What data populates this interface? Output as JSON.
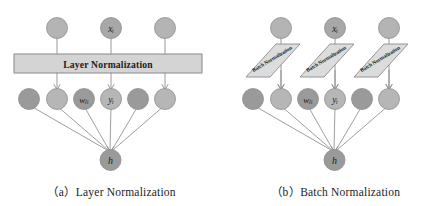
{
  "figure": {
    "background_color": "#ffffff",
    "panels": [
      {
        "id": "a",
        "caption": "（a）Layer Normalization",
        "caption_index": "（a）",
        "caption_text": "Layer Normalization",
        "norm_block": {
          "kind": "rectangle",
          "label": "Layer Normalization",
          "fill_color": "#d4d4d4",
          "stroke_color": "#8a8a8a"
        },
        "input_nodes": [
          {
            "label": "",
            "color": "#b4b4b4"
          },
          {
            "label": "xᵢ",
            "color": "#a8a8a8"
          },
          {
            "label": "",
            "color": "#b4b4b4"
          }
        ],
        "hidden_nodes": [
          {
            "label": "",
            "color": "#9a9a9a"
          },
          {
            "label": "",
            "color": "#b6b6b6"
          },
          {
            "label": "wⱼᵢ",
            "color": "#9a9a9a"
          },
          {
            "label": "yᵢ",
            "color": "#b6b6b6"
          },
          {
            "label": "",
            "color": "#9a9a9a"
          },
          {
            "label": "",
            "color": "#b6b6b6"
          }
        ],
        "output_node": {
          "label": "h",
          "color": "#9a9a9a"
        }
      },
      {
        "id": "b",
        "caption": "（b）Batch Normalization",
        "caption_index": "（b）",
        "caption_text": "Batch Normalization",
        "norm_block": {
          "kind": "parallelogram",
          "label": "Batch Normalization",
          "count": 3,
          "fill_color": "#dcdcdc",
          "stroke_color": "#8a8a8a",
          "text_rotation_deg": -31
        },
        "input_nodes": [
          {
            "label": "",
            "color": "#b4b4b4"
          },
          {
            "label": "xᵢ",
            "color": "#a8a8a8"
          },
          {
            "label": "",
            "color": "#b4b4b4"
          }
        ],
        "hidden_nodes": [
          {
            "label": "",
            "color": "#9a9a9a"
          },
          {
            "label": "",
            "color": "#b6b6b6"
          },
          {
            "label": "wⱼᵢ",
            "color": "#9a9a9a"
          },
          {
            "label": "yᵢ",
            "color": "#b6b6b6"
          },
          {
            "label": "",
            "color": "#9a9a9a"
          },
          {
            "label": "",
            "color": "#b6b6b6"
          }
        ],
        "output_node": {
          "label": "h",
          "color": "#9a9a9a"
        }
      }
    ],
    "edge_color": "#8d8d8d",
    "node_stroke_color": "#8d8d8d",
    "label_color": "#222222"
  }
}
